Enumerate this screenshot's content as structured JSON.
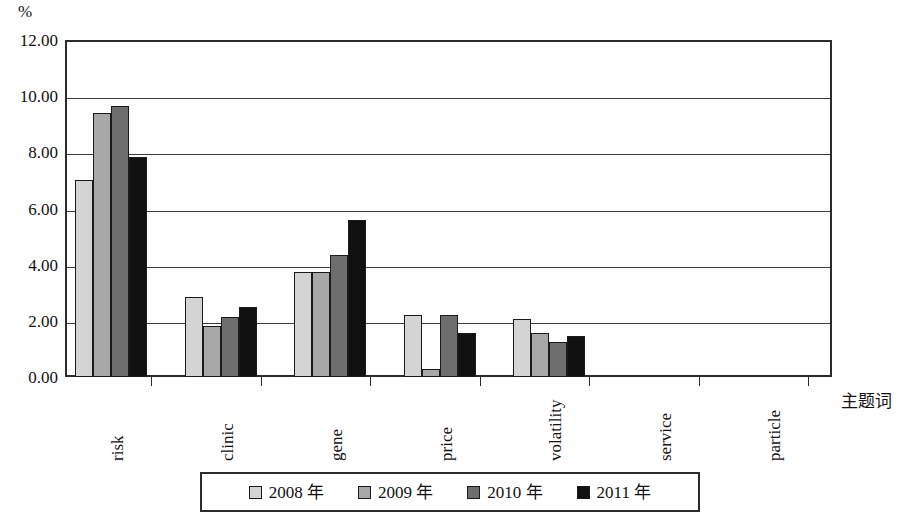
{
  "chart_data": {
    "type": "bar",
    "title": "",
    "subtitle": "",
    "xlabel": "主题词",
    "ylabel": "%",
    "y_unit_label": "%",
    "ylim": [
      0,
      12
    ],
    "ytick_step": 2,
    "ytick_labels": [
      "12.00",
      "10.00",
      "8.00",
      "6.00",
      "4.00",
      "2.00",
      "0.00"
    ],
    "ytick_values": [
      12,
      10,
      8,
      6,
      4,
      2,
      0
    ],
    "grid": true,
    "grid_axis": "y",
    "legend_position": "bottom",
    "categories": [
      "risk",
      "clinic",
      "gene",
      "price",
      "volatility",
      "service",
      "particle"
    ],
    "series": [
      {
        "name": "2008 年",
        "color": "#d4d4d4",
        "values": [
          7.0,
          2.85,
          3.75,
          2.2,
          2.05,
          0.0,
          0.0
        ]
      },
      {
        "name": "2009 年",
        "color": "#a8a8a8",
        "values": [
          9.4,
          1.8,
          3.75,
          0.3,
          1.55,
          0.0,
          0.0
        ]
      },
      {
        "name": "2010 年",
        "color": "#6e6e6e",
        "values": [
          9.65,
          2.15,
          4.35,
          2.2,
          1.25,
          0.0,
          0.0
        ]
      },
      {
        "name": "2011 年",
        "color": "#111111",
        "values": [
          7.85,
          2.5,
          5.6,
          1.55,
          1.45,
          0.0,
          0.0
        ]
      }
    ]
  },
  "legend": {
    "items": [
      {
        "label": "2008 年",
        "swatch": "legend-swatch-2008"
      },
      {
        "label": "2009 年",
        "swatch": "legend-swatch-2009"
      },
      {
        "label": "2010 年",
        "swatch": "legend-swatch-2010"
      },
      {
        "label": "2011 年",
        "swatch": "legend-swatch-2011"
      }
    ]
  }
}
